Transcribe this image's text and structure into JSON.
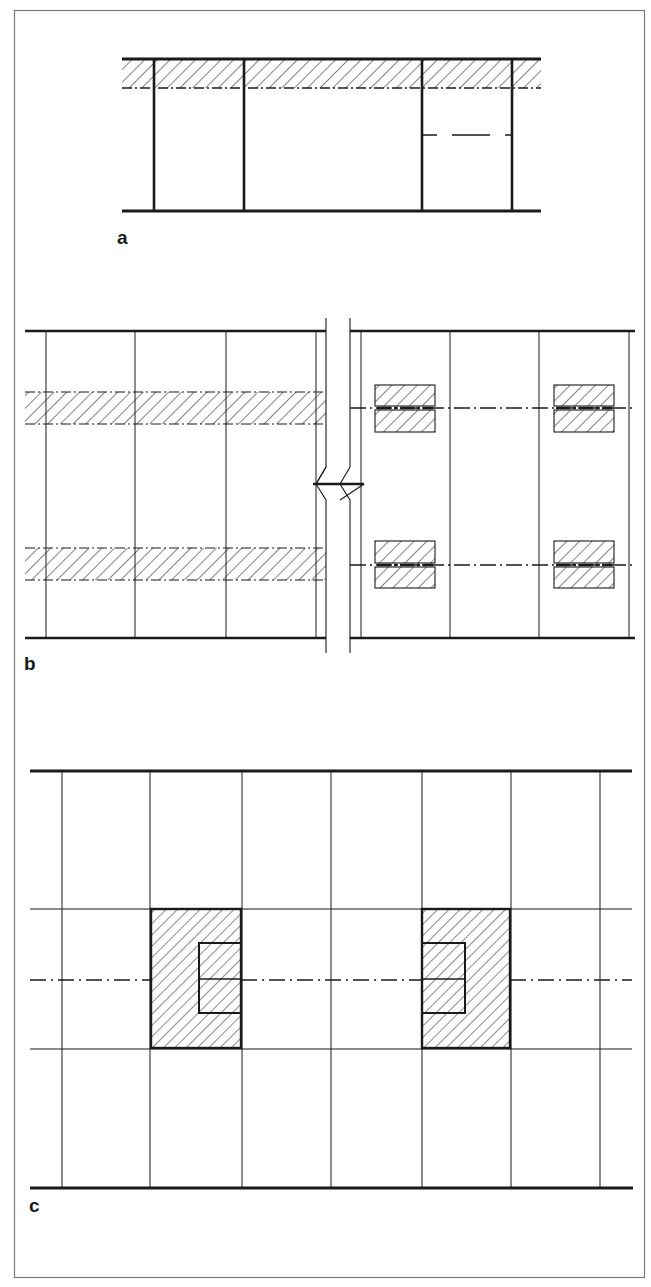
{
  "figure": {
    "type": "architectural structural section/plan drawings",
    "colors": {
      "ink": "#1a1a1a",
      "frame": "#7a7a7a",
      "background": "#ffffff"
    },
    "panels": [
      {
        "id": "a",
        "label": "a",
        "description": "Elevation: slab band with hatched beam, four columns, dashed line in right bay"
      },
      {
        "id": "b",
        "label": "b",
        "description": "Plan with break line: continuous hatched beam strips (left) vs. discrete hatched pads on axes (right)"
      },
      {
        "id": "c",
        "label": "c",
        "description": "Plan grid with two hatched column zones and inner cut-outs on dash-dot axis"
      }
    ]
  }
}
